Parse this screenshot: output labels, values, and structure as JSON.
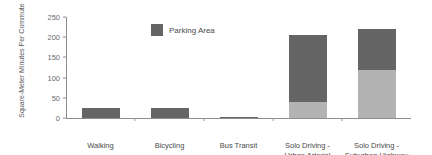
{
  "chart_data": {
    "type": "bar",
    "subtype": "stacked-bar",
    "title": "",
    "xlabel": "",
    "ylabel": "Square-Meter Minutes Per Commute",
    "ylim": [
      0,
      250
    ],
    "yticks": [
      0,
      50,
      100,
      150,
      200,
      250
    ],
    "ytick_labels": [
      "0",
      "50",
      "100",
      "150",
      "200",
      "250"
    ],
    "grid": false,
    "categories": [
      "Walking",
      "Bicycling",
      "Bus Transit",
      "Solo Driving -\nUrban Arterial",
      "Solo Driving -\nSuburban Highway"
    ],
    "category_lines": [
      [
        "Walking"
      ],
      [
        "Bicycling"
      ],
      [
        "Bus Transit"
      ],
      [
        "Solo Driving -",
        "Urban Arterial"
      ],
      [
        "Solo Driving -",
        "Suburban Highway"
      ]
    ],
    "series": [
      {
        "name": "Travel Area",
        "color": "#b3b3b3",
        "values": [
          0,
          0,
          0,
          40,
          120
        ]
      },
      {
        "name": "Parking Area",
        "color": "#656565",
        "values": [
          25,
          25,
          2,
          165,
          100
        ]
      }
    ],
    "totals": [
      25,
      25,
      2,
      205,
      220
    ],
    "legend": {
      "position": "top-center-inside",
      "entries": [
        {
          "label": "Parking Area",
          "color": "#656565"
        }
      ]
    },
    "colors": {
      "dark": "#656565",
      "light": "#b3b3b3",
      "axis": "#8d8d8d",
      "text": "#4a4a4a",
      "tick_text": "#6b6b6b",
      "background": "#ffffff"
    }
  }
}
